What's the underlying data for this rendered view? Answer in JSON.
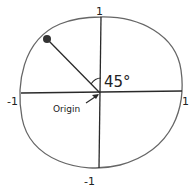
{
  "diagram": {
    "axis_labels": {
      "top": "1",
      "bottom": "-1",
      "left": "-1",
      "right": "1"
    },
    "angle_label": "45°",
    "origin_label": "Origin",
    "point": {
      "description": "point on circle at 135°"
    },
    "colors": {
      "stroke": "#2a2a2a",
      "circle": "#555555",
      "point": "#333333",
      "background": "#ffffff"
    }
  }
}
